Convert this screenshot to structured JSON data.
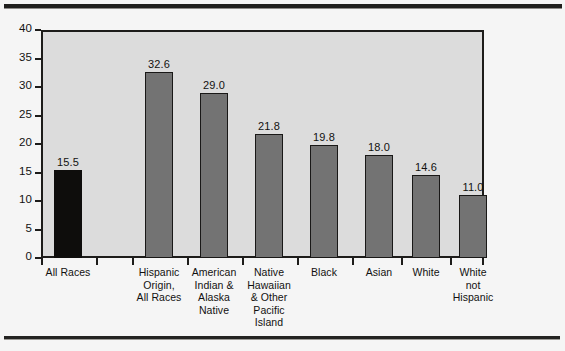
{
  "figure": {
    "rules": {
      "top_rule": "horizontal-rule",
      "bottom_rule": "horizontal-rule"
    }
  },
  "chart_data": {
    "type": "bar",
    "title": "",
    "xlabel": "",
    "ylabel": "",
    "ylim": [
      0,
      40
    ],
    "yticks": [
      0,
      5,
      10,
      15,
      20,
      25,
      30,
      35,
      40
    ],
    "ytick_labels": [
      "0",
      "5",
      "10",
      "15",
      "20",
      "25",
      "30",
      "35",
      "40"
    ],
    "grid": false,
    "legend": "none",
    "categories": [
      "All Races",
      "Hispanic Origin, All Races",
      "American Indian & Alaska Native",
      "Native Hawaiian & Other Pacific Island",
      "Black",
      "Asian",
      "White",
      "White not Hispanic"
    ],
    "category_label_lines": [
      [
        "All Races"
      ],
      [
        "Hispanic",
        "Origin,",
        "All Races"
      ],
      [
        "American",
        "Indian &",
        "Alaska",
        "Native"
      ],
      [
        "Native",
        "Hawaiian",
        "& Other",
        "Pacific",
        "Island"
      ],
      [
        "Black"
      ],
      [
        "Asian"
      ],
      [
        "White"
      ],
      [
        "White",
        "not",
        "Hispanic"
      ]
    ],
    "values": [
      15.5,
      32.6,
      29.0,
      21.8,
      19.8,
      18.0,
      14.6,
      11.0
    ],
    "value_labels": [
      "15.5",
      "32.6",
      "29.0",
      "21.8",
      "19.8",
      "18.0",
      "14.6",
      "11.0"
    ],
    "bar_colors": [
      "black",
      "gray",
      "gray",
      "gray",
      "gray",
      "gray",
      "gray",
      "gray"
    ],
    "colors": {
      "bar_gray_fill": "#737373",
      "bar_black_fill": "#0e0d0c",
      "bar_outline": "#191817",
      "plot_background": "#dcdcdc",
      "page_background": "#f5f5f5",
      "axis": "#1d1c1a",
      "text": "#121110"
    },
    "layout": {
      "plot_left": 41,
      "plot_top": 30,
      "plot_width": 443,
      "plot_height": 228,
      "bar_slots": [
        {
          "center": 27,
          "width": 28
        },
        {
          "center": 118,
          "width": 28
        },
        {
          "center": 173,
          "width": 28
        },
        {
          "center": 228,
          "width": 28
        },
        {
          "center": 283,
          "width": 28
        },
        {
          "center": 338,
          "width": 28
        },
        {
          "center": 385,
          "width": 28
        },
        {
          "center": 432,
          "width": 28
        }
      ],
      "x_tick_positions": [
        0,
        55,
        91,
        146,
        201,
        256,
        311,
        360,
        409,
        443
      ],
      "label_slots": [
        {
          "center": 27,
          "width": 86
        },
        {
          "center": 118,
          "width": 54
        },
        {
          "center": 173,
          "width": 54
        },
        {
          "center": 228,
          "width": 54
        },
        {
          "center": 283,
          "width": 54
        },
        {
          "center": 338,
          "width": 50
        },
        {
          "center": 385,
          "width": 50
        },
        {
          "center": 432,
          "width": 56
        }
      ]
    }
  }
}
